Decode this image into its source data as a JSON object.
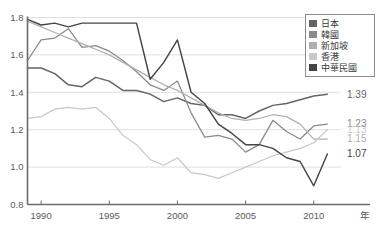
{
  "chart_data": {
    "type": "line",
    "title": "",
    "xlabel": "年",
    "ylabel": "",
    "xlim": [
      1989,
      2012
    ],
    "ylim": [
      0.8,
      1.8
    ],
    "grid": true,
    "legend_position": "top-right",
    "ytick_labels": [
      "1.8",
      "1.6",
      "1.4",
      "1.2",
      "1.0",
      "0.8"
    ],
    "ytick_values": [
      1.8,
      1.6,
      1.4,
      1.2,
      1.0,
      0.8
    ],
    "xtick_labels": [
      "1990",
      "1995",
      "2000",
      "2005",
      "2010"
    ],
    "xtick_values": [
      1990,
      1995,
      2000,
      2005,
      2010
    ],
    "x": [
      1989,
      1990,
      1991,
      1992,
      1993,
      1994,
      1995,
      1996,
      1997,
      1998,
      1999,
      2000,
      2001,
      2002,
      2003,
      2004,
      2005,
      2006,
      2007,
      2008,
      2009,
      2010,
      2011
    ],
    "series": [
      {
        "name": "日本",
        "color": "#646464",
        "end_label": "1.39",
        "values": [
          1.53,
          1.53,
          1.5,
          1.44,
          1.43,
          1.48,
          1.46,
          1.41,
          1.41,
          1.39,
          1.35,
          1.37,
          1.34,
          1.33,
          1.28,
          1.28,
          1.26,
          1.3,
          1.33,
          1.34,
          1.36,
          1.38,
          1.39
        ]
      },
      {
        "name": "韓國",
        "color": "#8a8a8a",
        "end_label": "1.23",
        "values": [
          1.57,
          1.68,
          1.69,
          1.74,
          1.64,
          1.65,
          1.62,
          1.57,
          1.51,
          1.44,
          1.41,
          1.46,
          1.29,
          1.16,
          1.17,
          1.15,
          1.08,
          1.12,
          1.25,
          1.19,
          1.15,
          1.22,
          1.23
        ]
      },
      {
        "name": "新加坡",
        "color": "#b0b0b0",
        "end_label": "1.15",
        "values": [
          1.78,
          1.75,
          1.72,
          1.69,
          1.66,
          1.63,
          1.6,
          1.56,
          1.52,
          1.48,
          1.44,
          1.41,
          1.37,
          1.33,
          1.29,
          1.26,
          1.25,
          1.26,
          1.28,
          1.27,
          1.23,
          1.15,
          1.15
        ]
      },
      {
        "name": "香港",
        "color": "#c9c9c9",
        "end_label": "1.13",
        "values": [
          1.26,
          1.27,
          1.31,
          1.32,
          1.31,
          1.32,
          1.26,
          1.17,
          1.12,
          1.04,
          1.01,
          1.05,
          0.97,
          0.96,
          0.94,
          0.97,
          1.0,
          1.03,
          1.06,
          1.08,
          1.1,
          1.13,
          1.2
        ]
      },
      {
        "name": "中華民國",
        "color": "#454545",
        "end_label": "1.07",
        "values": [
          1.79,
          1.76,
          1.77,
          1.75,
          1.77,
          1.77,
          1.77,
          1.77,
          1.77,
          1.47,
          1.56,
          1.68,
          1.4,
          1.34,
          1.23,
          1.18,
          1.12,
          1.12,
          1.1,
          1.05,
          1.03,
          0.9,
          1.07
        ]
      }
    ]
  },
  "legend": {
    "items": [
      {
        "label": "日本",
        "color": "#646464"
      },
      {
        "label": "韓國",
        "color": "#8a8a8a"
      },
      {
        "label": "新加坡",
        "color": "#b0b0b0"
      },
      {
        "label": "香港",
        "color": "#c9c9c9"
      },
      {
        "label": "中華民國",
        "color": "#454545"
      }
    ]
  },
  "axis": {
    "unit_label": "年"
  }
}
